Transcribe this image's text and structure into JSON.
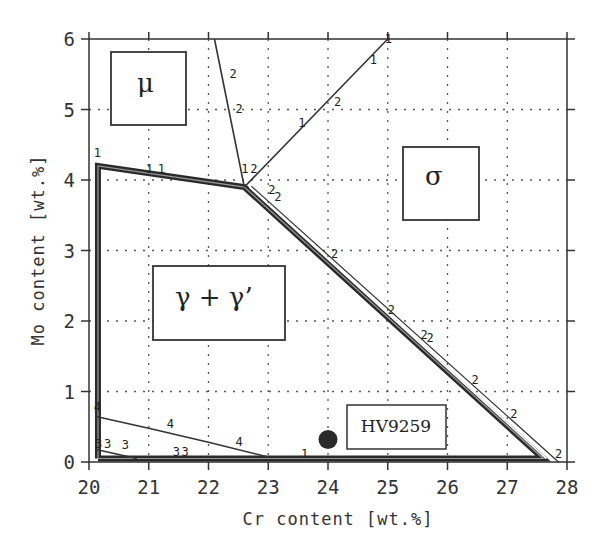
{
  "chart_data": {
    "type": "line",
    "title": "",
    "xlabel": "Cr content [wt.%]",
    "ylabel": "Mo content [wt.%]",
    "xlim": [
      20,
      28
    ],
    "ylim": [
      0,
      6
    ],
    "xticks": [
      "20",
      "21",
      "22",
      "23",
      "24",
      "25",
      "26",
      "27",
      "28"
    ],
    "yticks": [
      "0",
      "1",
      "2",
      "3",
      "4",
      "5",
      "6"
    ],
    "grid": true,
    "legend": null,
    "regions": [
      {
        "name": "mu",
        "label": "μ",
        "x": 20.6,
        "y": 5.2
      },
      {
        "name": "sigma",
        "label": "σ",
        "x": 25.6,
        "y": 3.9
      },
      {
        "name": "gamma-gamma-prime",
        "label": "γ + γ’",
        "x": 21.6,
        "y": 2.4
      }
    ],
    "series": [
      {
        "name": "gamma single-phase boundary",
        "style": "thick",
        "x": [
          20.15,
          20.15,
          22.6,
          27.6,
          20.15
        ],
        "y": [
          0.05,
          4.2,
          3.9,
          0.05,
          0.05
        ]
      },
      {
        "name": "boundary 2 (mu/sigma)",
        "label": "2",
        "x": [
          22.1,
          22.6
        ],
        "y": [
          6.0,
          3.9
        ]
      },
      {
        "name": "boundary 1 (sigma upper)",
        "label": "1",
        "x": [
          22.6,
          25.0
        ],
        "y": [
          3.9,
          6.0
        ]
      },
      {
        "name": "boundary 4",
        "label": "4",
        "x": [
          20.1,
          21.0,
          22.0,
          23.0
        ],
        "y": [
          0.65,
          0.48,
          0.28,
          0.07
        ]
      },
      {
        "name": "boundary 3",
        "label": "3",
        "x": [
          20.1,
          20.8
        ],
        "y": [
          0.18,
          0.05
        ]
      }
    ],
    "points": [
      {
        "name": "HV9259",
        "label": "HV9259",
        "x": 24.0,
        "y": 0.32
      }
    ],
    "line_labels": [
      {
        "text": "1",
        "x": 20.08,
        "y": 4.32
      },
      {
        "text": "1",
        "x": 20.95,
        "y": 4.1
      },
      {
        "text": "1",
        "x": 21.15,
        "y": 4.1
      },
      {
        "text": "2",
        "x": 22.35,
        "y": 5.45
      },
      {
        "text": "2",
        "x": 22.45,
        "y": 4.95
      },
      {
        "text": "1",
        "x": 22.55,
        "y": 4.1
      },
      {
        "text": "2",
        "x": 22.7,
        "y": 4.1
      },
      {
        "text": "2",
        "x": 23.0,
        "y": 3.8
      },
      {
        "text": "2",
        "x": 23.1,
        "y": 3.7
      },
      {
        "text": "1",
        "x": 23.5,
        "y": 4.75
      },
      {
        "text": "2",
        "x": 24.1,
        "y": 5.05
      },
      {
        "text": "1",
        "x": 24.7,
        "y": 5.65
      },
      {
        "text": "1",
        "x": 24.95,
        "y": 5.95
      },
      {
        "text": "2",
        "x": 24.05,
        "y": 2.9
      },
      {
        "text": "2",
        "x": 25.0,
        "y": 2.1
      },
      {
        "text": "2",
        "x": 25.55,
        "y": 1.75
      },
      {
        "text": "2",
        "x": 25.65,
        "y": 1.7
      },
      {
        "text": "2",
        "x": 26.4,
        "y": 1.1
      },
      {
        "text": "2",
        "x": 27.05,
        "y": 0.62
      },
      {
        "text": "2",
        "x": 27.8,
        "y": 0.05
      },
      {
        "text": "4",
        "x": 20.08,
        "y": 0.72
      },
      {
        "text": "4",
        "x": 21.3,
        "y": 0.48
      },
      {
        "text": "4",
        "x": 22.45,
        "y": 0.22
      },
      {
        "text": "3",
        "x": 20.1,
        "y": 0.2
      },
      {
        "text": "3",
        "x": 20.25,
        "y": 0.2
      },
      {
        "text": "3",
        "x": 20.55,
        "y": 0.18
      },
      {
        "text": "3",
        "x": 21.4,
        "y": 0.08
      },
      {
        "text": "3",
        "x": 21.55,
        "y": 0.08
      },
      {
        "text": "1",
        "x": 23.55,
        "y": 0.05
      }
    ]
  },
  "axes": {
    "xlabel": "Cr content [wt.%]",
    "ylabel": "Mo content [wt.%]"
  },
  "regions": {
    "mu": "μ",
    "sigma": "σ",
    "gamma": "γ + γ’"
  },
  "sample": {
    "label": "HV9259"
  }
}
